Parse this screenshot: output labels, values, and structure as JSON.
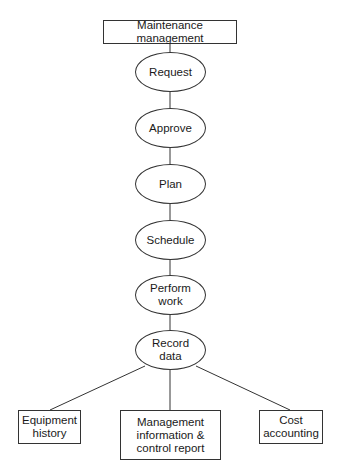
{
  "diagram": {
    "type": "flowchart",
    "root": {
      "label": "Maintenance management"
    },
    "steps": [
      {
        "label": "Request"
      },
      {
        "label": "Approve"
      },
      {
        "label": "Plan"
      },
      {
        "label": "Schedule"
      },
      {
        "label": "Perform work"
      },
      {
        "label": "Record data"
      }
    ],
    "outputs": [
      {
        "label": "Equipment history"
      },
      {
        "label": "Management information & control report"
      },
      {
        "label": "Cost accounting"
      }
    ],
    "colors": {
      "stroke": "#333333",
      "text": "#1a1a1a",
      "background": "#ffffff"
    }
  }
}
